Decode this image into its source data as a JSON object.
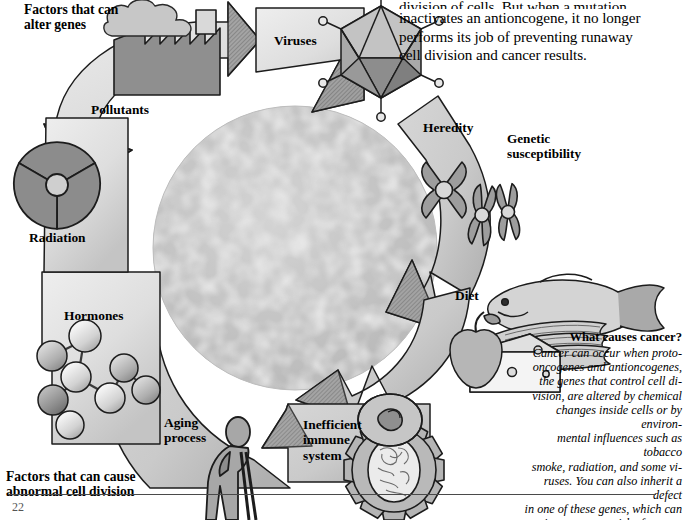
{
  "figure": {
    "kind": "cycle-diagram",
    "title_of_caption": "What causes cancer?",
    "page_number": "22"
  },
  "top_paragraph": {
    "clipped_first_line": "division of cells. But when a mutation",
    "lines": [
      "inactivates an antioncogene, it no longer",
      "performs its job of preventing runaway",
      "cell division and cancer results."
    ]
  },
  "annotations": {
    "alter_genes": "Factors that can\nalter genes",
    "abnormal_division": "Factors that can cause\nabnormal cell division",
    "genetic_susceptibility": "Genetic\nsusceptibility"
  },
  "segments": [
    {
      "id": "pollutants",
      "label": "Pollutants",
      "icon": "factory-icon",
      "group": "alter-genes"
    },
    {
      "id": "viruses",
      "label": "Viruses",
      "icon": "virus-icon",
      "group": "alter-genes"
    },
    {
      "id": "heredity",
      "label": "Heredity",
      "icon": "chromosome-icon",
      "group": "alter-genes"
    },
    {
      "id": "diet",
      "label": "Diet",
      "icon": "food-icon",
      "group": "abnormal-division"
    },
    {
      "id": "immune",
      "label": "Inefficient\nimmune\nsystem",
      "icon": "gear-cell-icon",
      "group": "abnormal-division"
    },
    {
      "id": "aging",
      "label": "Aging\nprocess",
      "icon": "elderly-person-icon",
      "group": "abnormal-division"
    },
    {
      "id": "hormones",
      "label": "Hormones",
      "icon": "molecule-icon",
      "group": "abnormal-division"
    },
    {
      "id": "radiation",
      "label": "Radiation",
      "icon": "radiation-icon",
      "group": "alter-genes"
    }
  ],
  "caption": {
    "title": "What causes cancer?",
    "lines": [
      "Cancer can occur when proto-",
      "oncogenes and antioncogenes,",
      "the genes that control cell di-",
      "vision, are altered by chemical",
      "changes inside cells or by environ-",
      "mental influences such as tobacco",
      "smoke, radiation, and some vi-",
      "ruses. You can also inherit a defect",
      "in one of these genes, which can",
      "increase your risk of cancer."
    ]
  },
  "colors": {
    "page_background": "#ffffff",
    "arrow_light": "#e3e3e3",
    "arrow_mid": "#c9c9c9",
    "arrow_dark": "#9a9a9a",
    "icon_fill_dark": "#8e8e8e",
    "icon_fill_mid": "#b4b4b4",
    "icon_fill_light": "#dcdcdc",
    "cell_mass_base": "#b0b0b0",
    "cell_mass_highlight": "#d6d6d6",
    "outline": "#1a1a1a",
    "text": "#000000"
  }
}
